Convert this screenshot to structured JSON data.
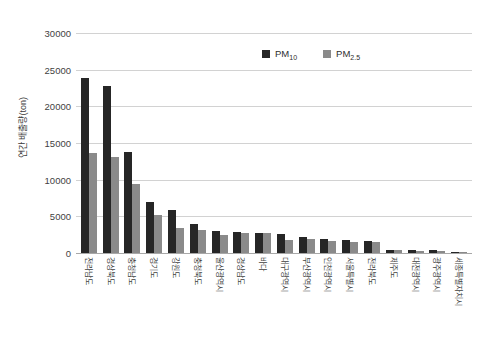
{
  "chart_data": {
    "type": "bar",
    "title": "",
    "xlabel": "",
    "ylabel": "연간 배출량(ton)",
    "ylim": [
      0,
      30000
    ],
    "ytick_labels": [
      "30000",
      "25000",
      "20000",
      "15000",
      "10000",
      "5000",
      "0"
    ],
    "ytick_values": [
      30000,
      25000,
      20000,
      15000,
      10000,
      5000,
      0
    ],
    "grid": true,
    "legend_position": "top-right-inside",
    "categories": [
      "전라남도",
      "경상북도",
      "충청남도",
      "경기도",
      "강원도",
      "충청북도",
      "울산광역시",
      "경상남도",
      "바다",
      "대구광역시",
      "부산광역시",
      "인천광역시",
      "서울특별시",
      "전라북도",
      "제주도",
      "대전광역시",
      "광주광역시",
      "세종특별자치시"
    ],
    "series": [
      {
        "name": "PM10",
        "label_main": "PM",
        "label_sub": "10",
        "color": "#262626",
        "values": [
          23900,
          22800,
          13800,
          6900,
          5800,
          4000,
          2950,
          2800,
          2750,
          2550,
          2200,
          1900,
          1750,
          1700,
          450,
          400,
          380,
          180
        ]
      },
      {
        "name": "PM2.5",
        "label_main": "PM",
        "label_sub": "2.5",
        "color": "#8a8a8a",
        "values": [
          13700,
          13100,
          9400,
          5200,
          3350,
          3100,
          2500,
          2700,
          2700,
          1750,
          1900,
          1700,
          1500,
          1450,
          400,
          330,
          330,
          150
        ]
      }
    ]
  },
  "colors": {
    "pm10": "#262626",
    "pm25": "#8a8a8a",
    "gridline": "#d2d2d2",
    "axis": "#a8a8a8",
    "text": "#3f3f3f",
    "background": "#ffffff"
  }
}
